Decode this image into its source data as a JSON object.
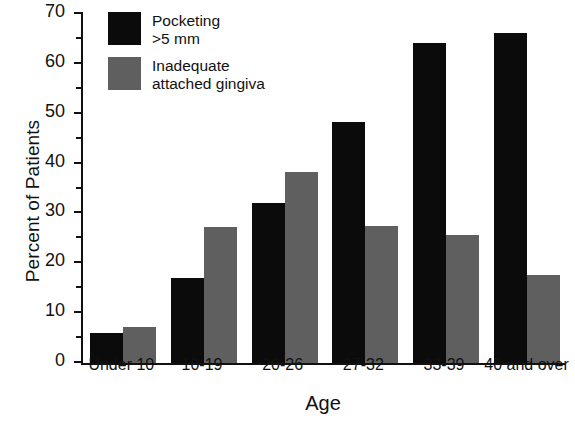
{
  "chart_data": {
    "type": "bar",
    "title": "",
    "subtitle": "",
    "xlabel": "Age",
    "ylabel": "Percent of Patients",
    "categories": [
      "Under 10",
      "10-19",
      "20-26",
      "27-32",
      "33-39",
      "40 and over"
    ],
    "series": [
      {
        "name": "Pocketing >5 mm",
        "name_lines": [
          "Pocketing",
          ">5 mm"
        ],
        "color": "#0b0b0b",
        "values": [
          6.0,
          17.0,
          32.1,
          48.4,
          64.2,
          66.2
        ]
      },
      {
        "name": "Inadequate attached gingiva",
        "name_lines": [
          "Inadequate",
          "attached gingiva"
        ],
        "color": "#5f5f5f",
        "values": [
          7.3,
          27.3,
          38.4,
          27.5,
          25.6,
          17.6
        ]
      }
    ],
    "ylim": [
      0,
      70
    ],
    "ytick_labels": [
      "0",
      "10",
      "20",
      "30",
      "40",
      "50",
      "60",
      "70"
    ],
    "ytick_values": [
      0,
      10,
      20,
      30,
      40,
      50,
      60,
      70
    ],
    "yminor_values": [
      5,
      15,
      25,
      35,
      45,
      55,
      65
    ],
    "grid": false,
    "legend_position": "top-left",
    "bar_group_mode": "grouped"
  }
}
